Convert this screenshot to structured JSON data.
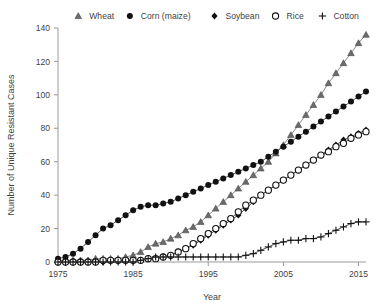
{
  "chart_data": {
    "type": "line",
    "title": "",
    "xlabel": "Year",
    "ylabel": "Number of Unique Resistant Cases",
    "xlim": [
      1975,
      2016
    ],
    "ylim": [
      0,
      140
    ],
    "xticks": [
      1975,
      1985,
      1995,
      2005,
      2015
    ],
    "yticks": [
      0,
      20,
      40,
      60,
      80,
      100,
      120,
      140
    ],
    "grid": false,
    "legend_position": "top",
    "x": [
      1975,
      1976,
      1977,
      1978,
      1979,
      1980,
      1981,
      1982,
      1983,
      1984,
      1985,
      1986,
      1987,
      1988,
      1989,
      1990,
      1991,
      1992,
      1993,
      1994,
      1995,
      1996,
      1997,
      1998,
      1999,
      2000,
      2001,
      2002,
      2003,
      2004,
      2005,
      2006,
      2007,
      2008,
      2009,
      2010,
      2011,
      2012,
      2013,
      2014,
      2015,
      2016
    ],
    "series": [
      {
        "name": "Wheat",
        "marker": "triangle",
        "color": "#5a5a5a",
        "values": [
          1,
          1,
          1,
          1,
          1,
          2,
          2,
          2,
          2,
          3,
          4,
          6,
          9,
          11,
          12,
          14,
          16,
          19,
          21,
          24,
          28,
          32,
          36,
          40,
          44,
          48,
          52,
          56,
          60,
          65,
          70,
          76,
          82,
          88,
          94,
          100,
          107,
          113,
          119,
          125,
          131,
          136
        ]
      },
      {
        "name": "Corn (maize)",
        "marker": "circle-filled",
        "color": "#1a1a1a",
        "values": [
          2,
          3,
          5,
          8,
          12,
          16,
          20,
          22,
          25,
          28,
          31,
          33,
          34,
          34,
          35,
          36,
          38,
          40,
          42,
          44,
          46,
          48,
          50,
          52,
          54,
          56,
          58,
          60,
          63,
          66,
          69,
          72,
          75,
          78,
          81,
          84,
          87,
          90,
          93,
          96,
          99,
          102
        ]
      },
      {
        "name": "Soybean",
        "marker": "diamond-filled",
        "color": "#1a1a1a",
        "values": [
          0,
          0,
          0,
          0,
          0,
          0,
          0,
          1,
          1,
          1,
          1,
          1,
          2,
          2,
          3,
          4,
          6,
          8,
          10,
          13,
          16,
          19,
          22,
          25,
          28,
          32,
          36,
          40,
          43,
          46,
          49,
          52,
          55,
          58,
          61,
          64,
          67,
          70,
          73,
          75,
          77,
          79
        ]
      },
      {
        "name": "Rice",
        "marker": "circle-open",
        "color": "#1a1a1a",
        "values": [
          0,
          0,
          0,
          0,
          0,
          0,
          1,
          1,
          1,
          1,
          1,
          1,
          2,
          2,
          3,
          4,
          6,
          8,
          11,
          14,
          17,
          20,
          23,
          26,
          30,
          34,
          37,
          40,
          43,
          46,
          49,
          52,
          55,
          58,
          61,
          64,
          66,
          69,
          71,
          74,
          76,
          78
        ]
      },
      {
        "name": "Cotton",
        "marker": "plus",
        "color": "#1a1a1a",
        "values": [
          0,
          0,
          0,
          0,
          0,
          0,
          0,
          0,
          0,
          0,
          0,
          1,
          2,
          3,
          3,
          3,
          3,
          3,
          3,
          3,
          3,
          3,
          3,
          3,
          3,
          4,
          5,
          7,
          9,
          11,
          12,
          13,
          13,
          14,
          14,
          15,
          17,
          19,
          21,
          23,
          24,
          24
        ]
      }
    ]
  }
}
